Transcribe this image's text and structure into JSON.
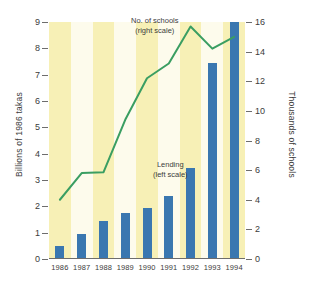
{
  "chart_data": {
    "type": "bar",
    "title": "",
    "categories": [
      "1986",
      "1987",
      "1988",
      "1989",
      "1990",
      "1991",
      "1992",
      "1993",
      "1994"
    ],
    "xlabel": "",
    "grid": false,
    "legend_position": "in-plot annotations",
    "series": [
      {
        "name": "Lending (left scale)",
        "type": "bar",
        "axis": "left",
        "color": "#3a77b0",
        "values": [
          0.5,
          0.95,
          1.45,
          1.75,
          1.95,
          2.4,
          3.45,
          7.45,
          9.0
        ]
      },
      {
        "name": "No. of schools (right scale)",
        "type": "line",
        "axis": "right",
        "color": "#3a9e62",
        "values": [
          4.0,
          5.8,
          5.85,
          9.4,
          12.2,
          13.2,
          15.7,
          14.2,
          15.0
        ]
      }
    ],
    "left_axis": {
      "label": "Billions of 1986 takas",
      "ticks": [
        0,
        1,
        2,
        3,
        4,
        5,
        6,
        7,
        8,
        9
      ],
      "lim": [
        0,
        9
      ]
    },
    "right_axis": {
      "label": "Thousands of schools",
      "ticks": [
        0,
        2,
        4,
        6,
        8,
        10,
        12,
        14,
        16
      ],
      "lim": [
        0,
        16
      ]
    },
    "annotations": [
      {
        "id": "schools",
        "text": "No. of schools\n(right scale)"
      },
      {
        "id": "lending",
        "text": "Lending\n(left scale)"
      }
    ],
    "colors": {
      "bar": "#3a77b0",
      "line": "#3a9e62",
      "stripe_dark": "#f7f0b6",
      "stripe_light": "#fdfbec",
      "axis": "#6d6d6d",
      "text": "#3b3b3b",
      "background": "#ffffff"
    }
  }
}
